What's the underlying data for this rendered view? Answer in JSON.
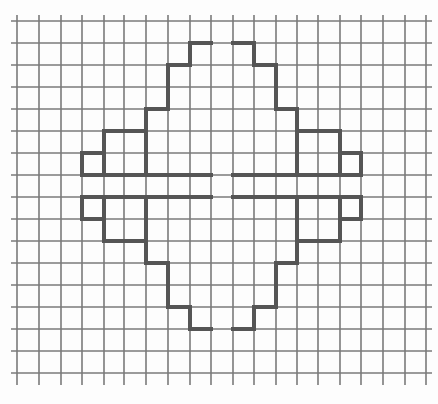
{
  "figure": {
    "colors": {
      "paper": "#fdfdfd",
      "grid": "#7a7a7a",
      "outline": "#555555"
    },
    "grid": {
      "columns_x": [
        17,
        39,
        61,
        82,
        104,
        124,
        146,
        168,
        190,
        211,
        233,
        254,
        276,
        297,
        318,
        340,
        361,
        383,
        405,
        426
      ],
      "rows_y": [
        21,
        43,
        65,
        87,
        109,
        131,
        153,
        175,
        197,
        219,
        241,
        263,
        285,
        307,
        329,
        351,
        373
      ],
      "x_extent": [
        17,
        426
      ],
      "y_extent": [
        21,
        373
      ]
    },
    "quadrants": [
      {
        "name": "top-left",
        "outline": [
          [
            211,
            43
          ],
          [
            190,
            43
          ],
          [
            190,
            65
          ],
          [
            168,
            65
          ],
          [
            168,
            109
          ],
          [
            146,
            109
          ],
          [
            146,
            131
          ],
          [
            104,
            131
          ],
          [
            104,
            153
          ],
          [
            82,
            153
          ],
          [
            82,
            175
          ],
          [
            211,
            175
          ]
        ],
        "dividers": [
          [
            [
              146,
              109
            ],
            [
              146,
              175
            ]
          ],
          [
            [
              104,
              131
            ],
            [
              104,
              175
            ]
          ]
        ]
      },
      {
        "name": "top-right",
        "outline": [
          [
            233,
            43
          ],
          [
            254,
            43
          ],
          [
            254,
            65
          ],
          [
            276,
            65
          ],
          [
            276,
            109
          ],
          [
            297,
            109
          ],
          [
            297,
            131
          ],
          [
            340,
            131
          ],
          [
            340,
            153
          ],
          [
            361,
            153
          ],
          [
            361,
            175
          ],
          [
            233,
            175
          ]
        ],
        "dividers": [
          [
            [
              297,
              109
            ],
            [
              297,
              175
            ]
          ],
          [
            [
              340,
              131
            ],
            [
              340,
              175
            ]
          ]
        ]
      },
      {
        "name": "bottom-left",
        "outline": [
          [
            211,
            197
          ],
          [
            82,
            197
          ],
          [
            82,
            219
          ],
          [
            104,
            219
          ],
          [
            104,
            241
          ],
          [
            146,
            241
          ],
          [
            146,
            263
          ],
          [
            168,
            263
          ],
          [
            168,
            307
          ],
          [
            190,
            307
          ],
          [
            190,
            329
          ],
          [
            211,
            329
          ]
        ],
        "dividers": [
          [
            [
              104,
              197
            ],
            [
              104,
              241
            ]
          ],
          [
            [
              146,
              197
            ],
            [
              146,
              263
            ]
          ]
        ]
      },
      {
        "name": "bottom-right",
        "outline": [
          [
            233,
            197
          ],
          [
            361,
            197
          ],
          [
            361,
            219
          ],
          [
            340,
            219
          ],
          [
            340,
            241
          ],
          [
            297,
            241
          ],
          [
            297,
            263
          ],
          [
            276,
            263
          ],
          [
            276,
            307
          ],
          [
            254,
            307
          ],
          [
            254,
            329
          ],
          [
            233,
            329
          ]
        ],
        "dividers": [
          [
            [
              340,
              197
            ],
            [
              340,
              241
            ]
          ],
          [
            [
              297,
              197
            ],
            [
              297,
              263
            ]
          ]
        ]
      }
    ]
  }
}
